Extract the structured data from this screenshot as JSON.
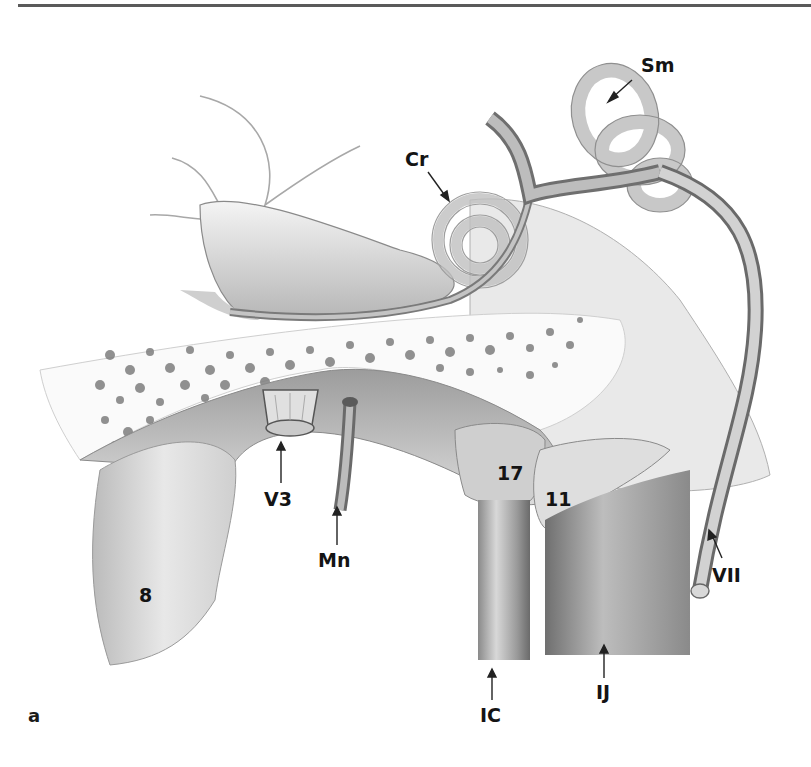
{
  "figure": {
    "panel_letter": "a",
    "labels": [
      {
        "id": "Sm",
        "text": "Sm",
        "meaning": "semicircular canals"
      },
      {
        "id": "Cr",
        "text": "Cr",
        "meaning": "cochlea"
      },
      {
        "id": "V3",
        "text": "V3",
        "meaning": "mandibular nerve (trigeminal V3)"
      },
      {
        "id": "Mn",
        "text": "Mn",
        "meaning": "middle meningeal artery"
      },
      {
        "id": "17",
        "text": "17"
      },
      {
        "id": "11",
        "text": "11"
      },
      {
        "id": "8",
        "text": "8"
      },
      {
        "id": "VII",
        "text": "VII",
        "meaning": "facial nerve"
      },
      {
        "id": "IC",
        "text": "IC",
        "meaning": "internal carotid artery"
      },
      {
        "id": "IJ",
        "text": "IJ",
        "meaning": "internal jugular vein"
      }
    ]
  },
  "colors": {
    "background": "#ffffff",
    "rule": "#5a5a5a",
    "ink": "#141414",
    "tissue_light": "#e4e4e4",
    "tissue_mid": "#b5b5b5",
    "tissue_dark": "#7a7a7a"
  }
}
